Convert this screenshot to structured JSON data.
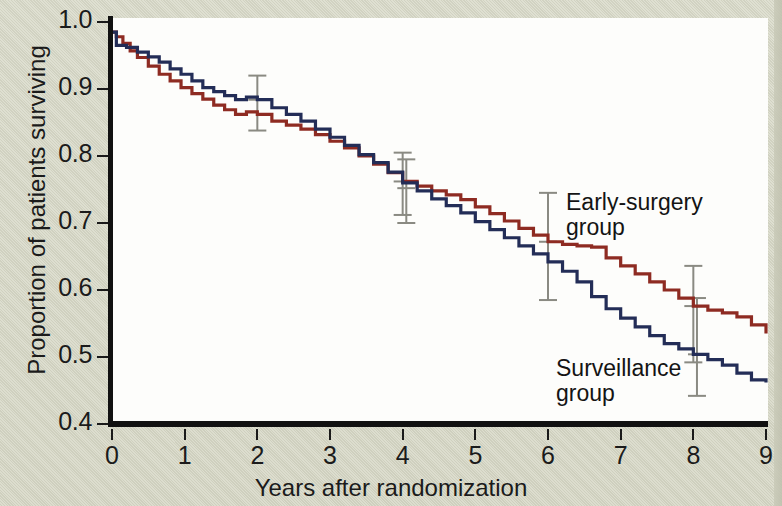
{
  "chart_data": {
    "type": "line",
    "title": "",
    "subtitle": "",
    "xlabel": "Years after randomization",
    "ylabel": "Proportion of patients surviving",
    "xlim": [
      0,
      9
    ],
    "ylim": [
      0.4,
      1.0
    ],
    "xticks": [
      "0",
      "1",
      "2",
      "3",
      "4",
      "5",
      "6",
      "7",
      "8",
      "9"
    ],
    "yticks": [
      "1.0",
      "0.9",
      "0.8",
      "0.7",
      "0.6",
      "0.5",
      "0.4"
    ],
    "grid": false,
    "legend_position": "inline-annotation",
    "annotations": [
      {
        "name": "early-surgery-label",
        "text": "Early-surgery\ngroup",
        "x": 7.0,
        "y": 0.755
      },
      {
        "name": "surveillance-label",
        "text": "Surveillance\ngroup",
        "x": 6.9,
        "y": 0.505
      }
    ],
    "series": [
      {
        "name": "Early-surgery group",
        "color": "#8e2b22",
        "style": "step",
        "x": [
          0.0,
          0.06,
          0.15,
          0.25,
          0.35,
          0.5,
          0.65,
          0.8,
          0.95,
          1.1,
          1.25,
          1.4,
          1.55,
          1.7,
          1.85,
          2.0,
          2.2,
          2.4,
          2.6,
          2.8,
          3.0,
          3.2,
          3.4,
          3.6,
          3.8,
          4.0,
          4.2,
          4.4,
          4.6,
          4.8,
          5.0,
          5.2,
          5.4,
          5.6,
          5.8,
          6.0,
          6.2,
          6.4,
          6.6,
          6.8,
          7.0,
          7.2,
          7.4,
          7.6,
          7.8,
          8.0,
          8.2,
          8.4,
          8.6,
          8.8,
          9.0
        ],
        "y": [
          0.985,
          0.978,
          0.968,
          0.957,
          0.947,
          0.934,
          0.922,
          0.912,
          0.902,
          0.893,
          0.885,
          0.876,
          0.869,
          0.862,
          0.866,
          0.862,
          0.852,
          0.846,
          0.84,
          0.832,
          0.822,
          0.812,
          0.8,
          0.788,
          0.775,
          0.762,
          0.755,
          0.748,
          0.742,
          0.735,
          0.724,
          0.714,
          0.703,
          0.692,
          0.682,
          0.672,
          0.668,
          0.666,
          0.664,
          0.648,
          0.636,
          0.624,
          0.612,
          0.6,
          0.588,
          0.576,
          0.57,
          0.566,
          0.56,
          0.548,
          0.535
        ]
      },
      {
        "name": "Surveillance group",
        "color": "#232d57",
        "style": "step",
        "x": [
          0.0,
          0.06,
          0.2,
          0.35,
          0.5,
          0.65,
          0.8,
          0.95,
          1.1,
          1.25,
          1.4,
          1.55,
          1.7,
          1.85,
          2.0,
          2.2,
          2.4,
          2.6,
          2.8,
          3.0,
          3.2,
          3.4,
          3.6,
          3.8,
          4.0,
          4.2,
          4.4,
          4.6,
          4.8,
          5.0,
          5.2,
          5.4,
          5.6,
          5.8,
          6.0,
          6.2,
          6.4,
          6.6,
          6.8,
          7.0,
          7.2,
          7.4,
          7.6,
          7.8,
          8.0,
          8.2,
          8.4,
          8.6,
          8.8,
          9.0
        ],
        "y": [
          0.985,
          0.965,
          0.962,
          0.955,
          0.948,
          0.94,
          0.93,
          0.922,
          0.912,
          0.902,
          0.896,
          0.89,
          0.884,
          0.888,
          0.884,
          0.872,
          0.862,
          0.852,
          0.84,
          0.828,
          0.816,
          0.802,
          0.79,
          0.776,
          0.76,
          0.748,
          0.736,
          0.726,
          0.715,
          0.702,
          0.69,
          0.678,
          0.666,
          0.654,
          0.642,
          0.628,
          0.612,
          0.59,
          0.572,
          0.558,
          0.545,
          0.532,
          0.52,
          0.512,
          0.504,
          0.496,
          0.488,
          0.476,
          0.466,
          0.462
        ]
      }
    ],
    "error_bars": [
      {
        "series": "Surveillance group",
        "x": 2.0,
        "y": 0.884,
        "low": 0.838,
        "high": 0.92
      },
      {
        "series": "Early-surgery group",
        "x": 4.0,
        "y": 0.762,
        "low": 0.712,
        "high": 0.805
      },
      {
        "series": "Surveillance group",
        "x": 4.05,
        "y": 0.752,
        "low": 0.7,
        "high": 0.795
      },
      {
        "series": "Early-surgery group",
        "x": 6.0,
        "y": 0.672,
        "low": 0.585,
        "high": 0.745
      },
      {
        "series": "Early-surgery group",
        "x": 8.0,
        "y": 0.576,
        "low": 0.492,
        "high": 0.636
      },
      {
        "series": "Surveillance group",
        "x": 8.05,
        "y": 0.504,
        "low": 0.442,
        "high": 0.588
      }
    ],
    "error_bar_color": "#8a8a82"
  },
  "figure": {
    "background_color": "#d9dac9",
    "plot_background_color": "#fdfdfb",
    "axis_color": "#111111"
  }
}
